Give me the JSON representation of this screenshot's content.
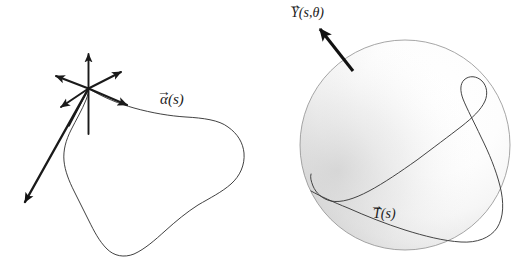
{
  "figure": {
    "background_color": "#ffffff",
    "ink_color": "#1a1a1a",
    "panels": [
      {
        "id": "left-panel",
        "name": "closed-space-curve-with-frame",
        "description": "A smooth closed plane-like space curve with a bundle of vectors drawn at one point of the curve",
        "curve_label": {
          "vector_accent": "→",
          "base_symbol": "α",
          "argument": "(s)",
          "full_text": "α⃗(s)"
        },
        "vector_bundle": {
          "origin_x": 88,
          "origin_y": 88,
          "count": 7,
          "arrow_color": "#1a1a1a"
        }
      },
      {
        "id": "right-panel",
        "name": "shaded-sphere-with-tangent-indicatrix",
        "description": "A shaded sphere with a looping closed curve (tangent indicatrix) traced on its surface",
        "sphere": {
          "center_x": 405,
          "center_y": 145,
          "radius": 105,
          "highlight_color": "#ffffff",
          "shadow_color": "#c9c9c9",
          "edge_color": "#9a9a9a"
        },
        "normal_label": {
          "vector_accent": "→",
          "base_symbol": "Y",
          "argument": "(s, θ)",
          "full_text": "Y⃗(s,θ)"
        },
        "tangent_label": {
          "vector_accent": "→",
          "base_symbol": "T",
          "argument": "(s)",
          "full_text": "T⃗(s)"
        },
        "pointer_arrow": {
          "from_x": 353,
          "from_y": 71,
          "to_x": 319,
          "to_y": 29,
          "color": "#111111"
        }
      }
    ]
  },
  "labels": {
    "alpha": {
      "accent": "→",
      "symbol": "α",
      "open": "(",
      "param": "s",
      "close": ")"
    },
    "Y": {
      "accent": "→",
      "symbol": "Y",
      "open": "(",
      "param": "s",
      "comma": ",",
      "param2": "θ",
      "close": ")"
    },
    "T": {
      "accent": "→",
      "symbol": "T",
      "open": "(",
      "param": "s",
      "close": ")"
    }
  }
}
